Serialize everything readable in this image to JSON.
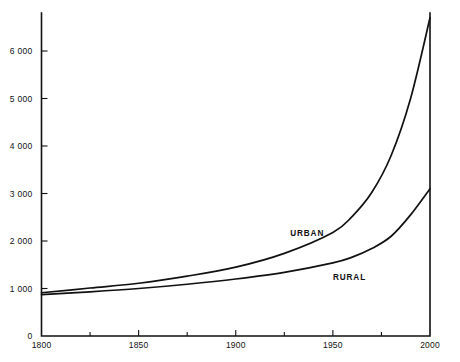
{
  "chart_data": {
    "type": "line",
    "title": "",
    "subtitle": "",
    "xlabel": "",
    "ylabel": "",
    "xlim": [
      1800,
      2000
    ],
    "ylim": [
      0,
      6800
    ],
    "grid": false,
    "legend_position": "inline-labels",
    "x_ticks_major": [
      1800,
      1850,
      1900,
      1950,
      2000
    ],
    "x_tick_labels": [
      "1800",
      "1850",
      "1900",
      "1950",
      "2000"
    ],
    "x_ticks_minor": [
      1825,
      1875,
      1925,
      1975
    ],
    "y_ticks": [
      0,
      1000,
      2000,
      3000,
      4000,
      5000,
      6000
    ],
    "y_tick_labels": [
      "0",
      "1 000",
      "2 000",
      "3 000",
      "4 000",
      "5 000",
      "6 000"
    ],
    "x": [
      1800,
      1825,
      1850,
      1875,
      1900,
      1925,
      1950,
      1960,
      1970,
      1980,
      1990,
      2000
    ],
    "series": [
      {
        "name": "URBAN",
        "label": "URBAN",
        "label_x": 1928,
        "label_y": 2100,
        "values": [
          910,
          1010,
          1110,
          1260,
          1450,
          1740,
          2180,
          2520,
          3020,
          3800,
          5000,
          6700
        ]
      },
      {
        "name": "RURAL",
        "label": "RURAL",
        "label_x": 1950,
        "label_y": 1180,
        "values": [
          870,
          930,
          1000,
          1090,
          1200,
          1340,
          1540,
          1660,
          1840,
          2100,
          2550,
          3100
        ]
      }
    ],
    "colors": {
      "line": "#111111",
      "axis": "#111111",
      "background": "#ffffff"
    }
  }
}
